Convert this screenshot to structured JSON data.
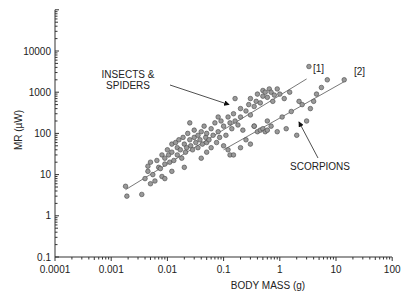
{
  "chart_data": {
    "type": "scatter",
    "title": "",
    "xlabel": "BODY MASS (g)",
    "ylabel": "MR (µW)",
    "xscale": "log",
    "yscale": "log",
    "xlim": [
      0.0001,
      100
    ],
    "ylim": [
      0.1,
      100000
    ],
    "x_ticks": [
      "0.0001",
      "0.001",
      "0.01",
      "0.1",
      "1",
      "10",
      "100"
    ],
    "y_ticks": [
      "0.1",
      "1",
      "10",
      "100",
      "1000",
      "10000"
    ],
    "grid": false,
    "legend": null,
    "annotations": [
      {
        "text_lines": [
          "INSECTS &",
          "SPIDERS"
        ],
        "arrow_to": [
          0.11,
          500
        ]
      },
      {
        "text_lines": [
          "SCORPIONS"
        ],
        "arrow_to": [
          2.0,
          250
        ]
      },
      {
        "text": "[1]",
        "at": [
          5,
          3500
        ]
      },
      {
        "text": "[2]",
        "at": [
          22,
          2000
        ]
      }
    ],
    "series": [
      {
        "name": "Insects & Spiders",
        "marker": "circle",
        "color": "#999999",
        "points": [
          [
            0.0018,
            5.2
          ],
          [
            0.0019,
            3
          ],
          [
            0.0035,
            3.3
          ],
          [
            0.004,
            8
          ],
          [
            0.0045,
            12
          ],
          [
            0.0045,
            16
          ],
          [
            0.005,
            20
          ],
          [
            0.005,
            6
          ],
          [
            0.0055,
            10
          ],
          [
            0.006,
            7
          ],
          [
            0.0065,
            22
          ],
          [
            0.007,
            15
          ],
          [
            0.0075,
            14
          ],
          [
            0.008,
            30
          ],
          [
            0.008,
            9
          ],
          [
            0.009,
            18
          ],
          [
            0.009,
            25
          ],
          [
            0.01,
            40
          ],
          [
            0.0105,
            30
          ],
          [
            0.011,
            20
          ],
          [
            0.012,
            55
          ],
          [
            0.012,
            35
          ],
          [
            0.013,
            22
          ],
          [
            0.014,
            60
          ],
          [
            0.015,
            45
          ],
          [
            0.015,
            30
          ],
          [
            0.016,
            70
          ],
          [
            0.017,
            40
          ],
          [
            0.018,
            25
          ],
          [
            0.019,
            80
          ],
          [
            0.02,
            55
          ],
          [
            0.021,
            35
          ],
          [
            0.022,
            45
          ],
          [
            0.023,
            100
          ],
          [
            0.025,
            70
          ],
          [
            0.026,
            50
          ],
          [
            0.028,
            40
          ],
          [
            0.03,
            80
          ],
          [
            0.03,
            120
          ],
          [
            0.032,
            60
          ],
          [
            0.035,
            90
          ],
          [
            0.035,
            45
          ],
          [
            0.038,
            70
          ],
          [
            0.04,
            110
          ],
          [
            0.042,
            55
          ],
          [
            0.045,
            150
          ],
          [
            0.048,
            80
          ],
          [
            0.05,
            60
          ],
          [
            0.05,
            100
          ],
          [
            0.055,
            70
          ],
          [
            0.06,
            130
          ],
          [
            0.06,
            45
          ],
          [
            0.065,
            90
          ],
          [
            0.07,
            180
          ],
          [
            0.075,
            60
          ],
          [
            0.08,
            110
          ],
          [
            0.085,
            80
          ],
          [
            0.09,
            200
          ],
          [
            0.1,
            150
          ],
          [
            0.1,
            50
          ],
          [
            0.11,
            90
          ],
          [
            0.12,
            250
          ],
          [
            0.13,
            180
          ],
          [
            0.14,
            130
          ],
          [
            0.15,
            300
          ],
          [
            0.16,
            200
          ],
          [
            0.18,
            160
          ],
          [
            0.2,
            400
          ],
          [
            0.2,
            250
          ],
          [
            0.22,
            120
          ],
          [
            0.25,
            350
          ],
          [
            0.28,
            500
          ],
          [
            0.3,
            280
          ],
          [
            0.3,
            700
          ],
          [
            0.35,
            450
          ],
          [
            0.38,
            600
          ],
          [
            0.4,
            900
          ],
          [
            0.45,
            550
          ],
          [
            0.5,
            800
          ],
          [
            0.5,
            1100
          ],
          [
            0.55,
            1000
          ],
          [
            0.6,
            750
          ],
          [
            0.65,
            1200
          ],
          [
            0.7,
            1000
          ],
          [
            0.75,
            600
          ],
          [
            0.8,
            850
          ],
          [
            0.9,
            1200
          ],
          [
            1.0,
            900
          ],
          [
            1.2,
            700
          ],
          [
            1.5,
            1000
          ],
          [
            0.02,
            15
          ],
          [
            0.012,
            12
          ],
          [
            0.009,
            8
          ],
          [
            0.04,
            25
          ],
          [
            0.16,
            700
          ],
          [
            0.08,
            250
          ],
          [
            0.025,
            180
          ],
          [
            0.05,
            35
          ],
          [
            3.3,
            4200
          ],
          [
            0.35,
            150
          ],
          [
            0.6,
            200
          ]
        ]
      },
      {
        "name": "Scorpions",
        "marker": "circle",
        "color": "#999999",
        "points": [
          [
            0.12,
            40
          ],
          [
            0.13,
            30
          ],
          [
            0.15,
            30
          ],
          [
            0.2,
            45
          ],
          [
            0.25,
            70
          ],
          [
            0.3,
            55
          ],
          [
            0.35,
            150
          ],
          [
            0.4,
            110
          ],
          [
            0.45,
            120
          ],
          [
            0.5,
            130
          ],
          [
            0.55,
            110
          ],
          [
            0.6,
            120
          ],
          [
            0.7,
            150
          ],
          [
            0.9,
            110
          ],
          [
            1.1,
            250
          ],
          [
            1.3,
            130
          ],
          [
            1.6,
            340
          ],
          [
            2.2,
            600
          ],
          [
            2.5,
            500
          ],
          [
            3.0,
            200
          ],
          [
            4.0,
            600
          ],
          [
            5.5,
            1300
          ],
          [
            7.0,
            2000
          ],
          [
            4.5,
            900
          ],
          [
            2.0,
            90
          ],
          [
            3.5,
            400
          ],
          [
            14,
            2000
          ]
        ]
      }
    ],
    "regression_lines": [
      {
        "label": "[1]",
        "from": [
          0.0018,
          4.3
        ],
        "to": [
          3.0,
          2100
        ]
      },
      {
        "label": "[2]",
        "from": [
          0.1,
          40
        ],
        "to": [
          15,
          1900
        ]
      }
    ]
  }
}
